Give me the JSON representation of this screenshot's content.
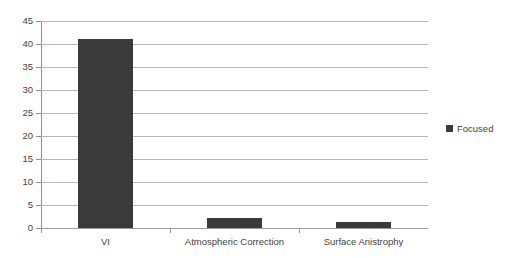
{
  "chart_data": {
    "type": "bar",
    "title": "",
    "xlabel": "",
    "ylabel": "",
    "categories": [
      "VI",
      "Atmospheric Correction",
      "Surface Anistrophy"
    ],
    "series": [
      {
        "name": "Focused",
        "color": "#3a3a3a",
        "values": [
          41,
          2.2,
          1.3
        ]
      }
    ],
    "ylim": [
      0,
      45
    ],
    "ytick_step": 5,
    "yticks": [
      0,
      5,
      10,
      15,
      20,
      25,
      30,
      35,
      40,
      45
    ],
    "ytick_labels": [
      "0",
      "5",
      "10",
      "15",
      "20",
      "25",
      "30",
      "35",
      "40",
      "45"
    ],
    "grid": true,
    "grid_axis": "y",
    "grid_color": "#b7b7b7",
    "legend": true,
    "legend_position": "right",
    "legend_entries": [
      "Focused"
    ],
    "background_color": "#ffffff",
    "axis_color": "#8e8e8e"
  },
  "legend": {
    "entries": [
      {
        "label": "Focused",
        "color": "#3a3a3a"
      }
    ]
  },
  "axes": {
    "y_tick_labels": [
      "45",
      "40",
      "35",
      "30",
      "25",
      "20",
      "15",
      "10",
      "5",
      "0"
    ],
    "x_tick_labels": [
      "VI",
      "Atmospheric Correction",
      "Surface Anistrophy"
    ]
  },
  "misc": {
    "cropped_top_text": ""
  }
}
